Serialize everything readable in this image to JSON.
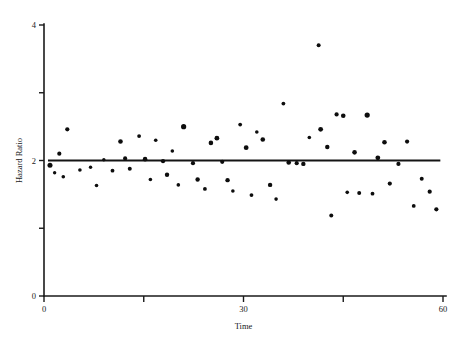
{
  "chart_data": {
    "type": "scatter",
    "title": "",
    "xlabel": "Time",
    "ylabel": "Hazard Ratio",
    "xlim": [
      0,
      60
    ],
    "ylim": [
      0,
      4
    ],
    "grid": false,
    "legend": null,
    "x_ticks": [
      0,
      15,
      30,
      45,
      60
    ],
    "x_tick_labels": [
      "0",
      "",
      "30",
      "",
      "60"
    ],
    "y_ticks": [
      0,
      1,
      2,
      3,
      4
    ],
    "y_tick_labels": [
      "0",
      "",
      "2",
      "",
      "4"
    ],
    "reference_line": {
      "orientation": "horizontal",
      "value": 2.0,
      "x_start": 0.6,
      "x_end": 59.6
    },
    "marker": {
      "shape": "circle",
      "color": "#0d0d0d",
      "size_small_px": 1.6,
      "size_large_px": 2.6
    },
    "series": [
      {
        "name": "Hazard Ratio",
        "points": [
          {
            "x": 0.9,
            "y": 1.93,
            "r": 2.5
          },
          {
            "x": 1.6,
            "y": 1.82,
            "r": 1.7
          },
          {
            "x": 2.3,
            "y": 2.1,
            "r": 2.1
          },
          {
            "x": 2.9,
            "y": 1.76,
            "r": 1.8
          },
          {
            "x": 3.5,
            "y": 2.46,
            "r": 2.1
          },
          {
            "x": 5.4,
            "y": 1.86,
            "r": 1.8
          },
          {
            "x": 7.0,
            "y": 1.9,
            "r": 1.7
          },
          {
            "x": 7.9,
            "y": 1.63,
            "r": 1.8
          },
          {
            "x": 9.0,
            "y": 2.01,
            "r": 1.7
          },
          {
            "x": 10.3,
            "y": 1.85,
            "r": 1.9
          },
          {
            "x": 11.5,
            "y": 2.28,
            "r": 2.3
          },
          {
            "x": 12.2,
            "y": 2.03,
            "r": 2.1
          },
          {
            "x": 12.9,
            "y": 1.88,
            "r": 2.0
          },
          {
            "x": 14.3,
            "y": 2.36,
            "r": 1.9
          },
          {
            "x": 15.2,
            "y": 2.02,
            "r": 2.3
          },
          {
            "x": 16.0,
            "y": 1.72,
            "r": 1.8
          },
          {
            "x": 16.8,
            "y": 2.3,
            "r": 1.8
          },
          {
            "x": 17.9,
            "y": 1.99,
            "r": 2.1
          },
          {
            "x": 18.5,
            "y": 1.79,
            "r": 2.2
          },
          {
            "x": 19.3,
            "y": 2.14,
            "r": 1.8
          },
          {
            "x": 20.2,
            "y": 1.64,
            "r": 1.8
          },
          {
            "x": 21.0,
            "y": 2.5,
            "r": 2.6
          },
          {
            "x": 22.4,
            "y": 1.96,
            "r": 2.1
          },
          {
            "x": 23.1,
            "y": 1.72,
            "r": 2.2
          },
          {
            "x": 24.2,
            "y": 1.58,
            "r": 1.9
          },
          {
            "x": 25.1,
            "y": 2.26,
            "r": 2.3
          },
          {
            "x": 26.0,
            "y": 2.33,
            "r": 2.4
          },
          {
            "x": 26.8,
            "y": 1.98,
            "r": 2.1
          },
          {
            "x": 27.6,
            "y": 1.71,
            "r": 2.2
          },
          {
            "x": 28.4,
            "y": 1.55,
            "r": 1.8
          },
          {
            "x": 29.5,
            "y": 2.53,
            "r": 1.9
          },
          {
            "x": 30.4,
            "y": 2.19,
            "r": 2.4
          },
          {
            "x": 31.2,
            "y": 1.49,
            "r": 1.9
          },
          {
            "x": 32.0,
            "y": 2.42,
            "r": 1.8
          },
          {
            "x": 32.9,
            "y": 2.31,
            "r": 2.3
          },
          {
            "x": 34.0,
            "y": 1.64,
            "r": 2.2
          },
          {
            "x": 34.9,
            "y": 1.43,
            "r": 1.8
          },
          {
            "x": 36.0,
            "y": 2.84,
            "r": 1.9
          },
          {
            "x": 36.8,
            "y": 1.97,
            "r": 2.3
          },
          {
            "x": 38.0,
            "y": 1.96,
            "r": 2.1
          },
          {
            "x": 39.0,
            "y": 1.95,
            "r": 2.2
          },
          {
            "x": 39.9,
            "y": 2.34,
            "r": 1.8
          },
          {
            "x": 41.3,
            "y": 3.7,
            "r": 2.0
          },
          {
            "x": 41.6,
            "y": 2.46,
            "r": 2.4
          },
          {
            "x": 42.6,
            "y": 2.2,
            "r": 2.2
          },
          {
            "x": 43.2,
            "y": 1.19,
            "r": 2.0
          },
          {
            "x": 44.0,
            "y": 2.68,
            "r": 2.1
          },
          {
            "x": 45.0,
            "y": 2.66,
            "r": 2.3
          },
          {
            "x": 45.6,
            "y": 1.53,
            "r": 1.8
          },
          {
            "x": 46.7,
            "y": 2.12,
            "r": 2.3
          },
          {
            "x": 47.4,
            "y": 1.52,
            "r": 2.0
          },
          {
            "x": 48.6,
            "y": 2.67,
            "r": 2.6
          },
          {
            "x": 49.4,
            "y": 1.51,
            "r": 1.9
          },
          {
            "x": 50.2,
            "y": 2.04,
            "r": 2.4
          },
          {
            "x": 51.2,
            "y": 2.27,
            "r": 2.3
          },
          {
            "x": 52.0,
            "y": 1.66,
            "r": 2.1
          },
          {
            "x": 53.3,
            "y": 1.95,
            "r": 2.1
          },
          {
            "x": 54.6,
            "y": 2.28,
            "r": 2.1
          },
          {
            "x": 55.6,
            "y": 1.33,
            "r": 1.9
          },
          {
            "x": 56.8,
            "y": 1.73,
            "r": 2.0
          },
          {
            "x": 58.0,
            "y": 1.54,
            "r": 2.1
          },
          {
            "x": 59.0,
            "y": 1.28,
            "r": 2.1
          }
        ]
      }
    ]
  }
}
